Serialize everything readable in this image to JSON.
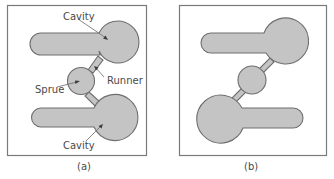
{
  "figure": {
    "panels": [
      {
        "id": "a",
        "caption": "(a)",
        "labels": {
          "cavity_top": "Cavity",
          "runner": "Runner",
          "sprue": "Sprue",
          "cavity_bottom": "Cavity"
        }
      },
      {
        "id": "b",
        "caption": "(b)"
      }
    ]
  },
  "colors": {
    "fill": "#c4c4c4",
    "outline": "#6e6e6e",
    "frame": "#7a7a7a",
    "text": "#4a4a4a"
  }
}
